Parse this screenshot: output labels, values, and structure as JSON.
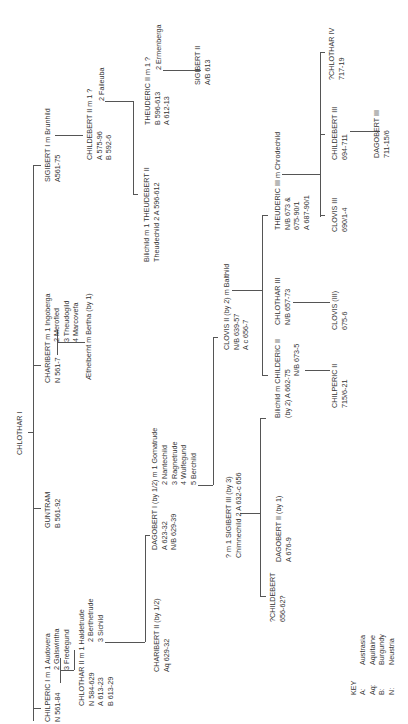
{
  "root": {
    "name": "CHLOTHAR I"
  },
  "generation1": {
    "chilperic_i": {
      "line1": "CHILPERIC I m 1 Audovera",
      "line2": "N 561-84",
      "wives": [
        "2 Galswintha",
        "3 Fredegund"
      ]
    },
    "guntram": {
      "line1": "GUNTRAM",
      "line2": "B 561-92"
    },
    "charibert": {
      "line1": "CHARIBERT m 1 Ingoberga",
      "line2": "N 561-7",
      "wives": [
        "2 Merofled",
        "3 Theudogild",
        "4 Marcovefa"
      ]
    },
    "sigibert_i": {
      "line1": "SIGIBERT I m Brunhild",
      "line2": "A561-75"
    }
  },
  "generation2": {
    "chlothar_ii": {
      "line1": "CHLOTHAR II m 1 Haldetrude",
      "reigns": [
        "N 584-629",
        "A 613-23",
        "B 613-29"
      ],
      "wives": [
        "2 Berthetrude",
        "3 Sichild"
      ]
    },
    "aethelberht": {
      "line1": "Æthelberht m Bertha (by 1)"
    },
    "childebert_ii": {
      "line1": "CHILDEBERT II m 1 ?",
      "reigns": [
        "A 575-96",
        "B 592-6"
      ],
      "wives": [
        "2 Faileuba"
      ]
    }
  },
  "generation3": {
    "charibert_ii": {
      "line1": "CHARIBERT II (by 1/2)",
      "line2": "Aq 629-32"
    },
    "dagobert_i": {
      "line1": "DAGOBERT I (by 1/2) m 1 Gomatrude",
      "reigns": [
        "A 623-32",
        "N/B 629-39"
      ],
      "wives": [
        "2 Nantechild",
        "3 Ragnetrude",
        "4 Wulfegund",
        "5 Berchild"
      ]
    },
    "theudebert_ii": {
      "line1": "Bilichild   m  1 THEUDEBERT II",
      "line2": "Theudechild     2 A 596-612"
    },
    "theuderic_ii": {
      "line1": "THEUDERIC II m 1 ?",
      "reigns": [
        "B 596-613",
        "A 612-13"
      ],
      "wives": [
        "2 Ermenberga"
      ]
    }
  },
  "generation4": {
    "sigibert_iii": {
      "line1": "? m 1 SIGIBERT III (by 3)",
      "line2": "Chimnechild  2 A 632-c 656"
    },
    "clovis_ii": {
      "line1": "CLOVIS II (by 2) m Balthild",
      "reigns": [
        "N/B 639-57",
        "A c 656-7"
      ]
    },
    "sigibert_ii": {
      "line1": "SIGIBERT II",
      "line2": "A/B 613"
    }
  },
  "generation5": {
    "childebert_q": {
      "line1": "?CHILDEBERT",
      "line2": "656-62?"
    },
    "dagobert_ii": {
      "line1": "DAGOBERT II (by 1)",
      "line2": "A 676-9"
    },
    "childeric_ii": {
      "line1": "Bilichild m CHILDERIC II",
      "line2": "(by 2)      A 662-75",
      "line3": "N/B 673-5"
    },
    "chlothar_iii": {
      "line1": "CHLOTHAR III",
      "line2": "N/B 657-73"
    },
    "theuderic_iii": {
      "line1": "THEUDERIC III m Chrodechild",
      "reigns": [
        "N/B 673 &",
        "675-90/1",
        "A 687-90/1"
      ]
    }
  },
  "generation6": {
    "chilperic_ii": {
      "line1": "CHILPERIC II",
      "line2": "715/6-21"
    },
    "clovis_iii_paren": {
      "line1": "CLOVIS (III)",
      "line2": "675-6"
    },
    "clovis_iii": {
      "line1": "CLOVIS III",
      "line2": "690/1-4"
    },
    "childebert_iii": {
      "line1": "CHILDEBERT III",
      "line2": "694-711"
    },
    "chlothar_iv": {
      "line1": "?CHLOTHAR IV",
      "line2": "717-19"
    }
  },
  "generation7": {
    "dagobert_iii": {
      "line1": "DAGOBERT III",
      "line2": "711-15/6"
    }
  },
  "key": {
    "title": "KEY",
    "entries": [
      {
        "abbr": "A:",
        "name": "Austrasia"
      },
      {
        "abbr": "Aq:",
        "name": "Aquitaine"
      },
      {
        "abbr": "B:",
        "name": "Burgundy"
      },
      {
        "abbr": "N:",
        "name": "Neustria"
      }
    ]
  }
}
